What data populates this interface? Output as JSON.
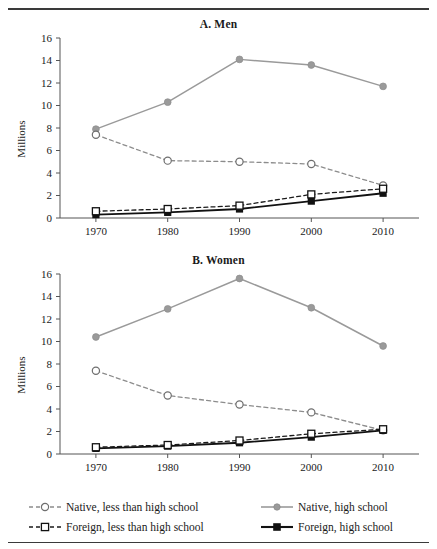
{
  "figure": {
    "ylabel": "Millions",
    "panels": [
      {
        "id": "A",
        "title": "A. Men"
      },
      {
        "id": "B",
        "title": "B. Women"
      }
    ]
  },
  "legend": {
    "items": [
      {
        "key": "native_lths",
        "label": "Native, less than high school",
        "marker": "open-circle",
        "line": "dashed",
        "color": "#8c8c8c"
      },
      {
        "key": "native_hs",
        "label": "Native, high school",
        "marker": "filled-circle",
        "line": "solid",
        "color": "#9a9a9a"
      },
      {
        "key": "foreign_lths",
        "label": "Foreign, less than high school",
        "marker": "open-square",
        "line": "dashed",
        "color": "#1a1a1a"
      },
      {
        "key": "foreign_hs",
        "label": "Foreign, high school",
        "marker": "filled-square",
        "line": "solid",
        "color": "#111111"
      }
    ]
  },
  "chart_data": [
    {
      "type": "line",
      "title": "A. Men",
      "xlabel": "",
      "ylabel": "Millions",
      "x": [
        1970,
        1980,
        1990,
        2000,
        2010
      ],
      "xticklabels": [
        "1970",
        "1980",
        "1990",
        "2000",
        "2010"
      ],
      "yticks": [
        0,
        2,
        4,
        6,
        8,
        10,
        12,
        14,
        16
      ],
      "ylim": [
        0,
        16
      ],
      "xlim": [
        1965,
        2015
      ],
      "grid": false,
      "legend_position": "bottom",
      "series": [
        {
          "name": "Native, less than high school",
          "values": [
            7.4,
            5.1,
            5.0,
            4.8,
            2.9
          ]
        },
        {
          "name": "Native, high school",
          "values": [
            7.9,
            10.3,
            14.1,
            13.6,
            11.7
          ]
        },
        {
          "name": "Foreign, less than high school",
          "values": [
            0.6,
            0.8,
            1.1,
            2.1,
            2.6
          ]
        },
        {
          "name": "Foreign, high school",
          "values": [
            0.3,
            0.5,
            0.8,
            1.5,
            2.2
          ]
        }
      ]
    },
    {
      "type": "line",
      "title": "B. Women",
      "xlabel": "",
      "ylabel": "Millions",
      "x": [
        1970,
        1980,
        1990,
        2000,
        2010
      ],
      "xticklabels": [
        "1970",
        "1980",
        "1990",
        "2000",
        "2010"
      ],
      "yticks": [
        0,
        2,
        4,
        6,
        8,
        10,
        12,
        14,
        16
      ],
      "ylim": [
        0,
        16
      ],
      "xlim": [
        1965,
        2015
      ],
      "grid": false,
      "legend_position": "bottom",
      "series": [
        {
          "name": "Native, less than high school",
          "values": [
            7.4,
            5.2,
            4.4,
            3.7,
            2.1
          ]
        },
        {
          "name": "Native, high school",
          "values": [
            10.4,
            12.9,
            15.6,
            13.0,
            9.6
          ]
        },
        {
          "name": "Foreign, less than high school",
          "values": [
            0.6,
            0.8,
            1.2,
            1.8,
            2.2
          ]
        },
        {
          "name": "Foreign, high school",
          "values": [
            0.5,
            0.7,
            1.0,
            1.5,
            2.1
          ]
        }
      ]
    }
  ]
}
